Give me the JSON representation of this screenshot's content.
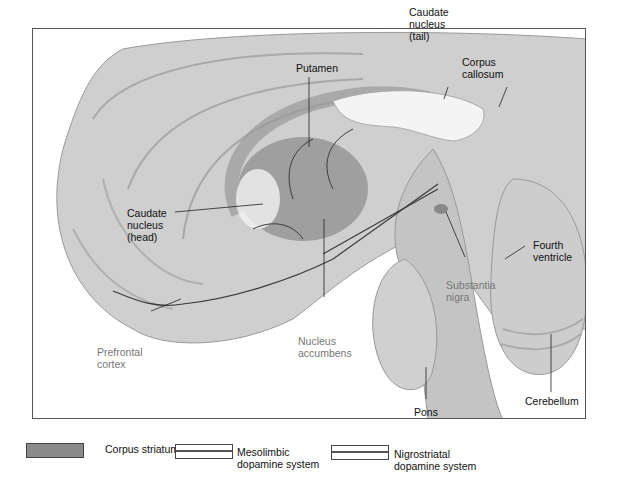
{
  "figure": {
    "labels": [
      {
        "id": "putamen",
        "text": "Putamen"
      },
      {
        "id": "caudate-tail",
        "text": "Caudate\nnucleus\n(tail)"
      },
      {
        "id": "corpus-callosum",
        "text": "Corpus\ncallosum"
      },
      {
        "id": "caudate-head",
        "text": "Caudate\nnucleus\n(head)"
      },
      {
        "id": "fourth-ventricle",
        "text": "Fourth\nventricle"
      },
      {
        "id": "substantia-nigra",
        "text": "Substantia\nnigra"
      },
      {
        "id": "prefrontal-cortex",
        "text": "Prefrontal\ncortex"
      },
      {
        "id": "nucleus-accumbens",
        "text": "Nucleus\naccumbens"
      },
      {
        "id": "pons",
        "text": "Pons"
      },
      {
        "id": "cerebellum",
        "text": "Cerebellum"
      }
    ]
  },
  "legend": {
    "items": [
      {
        "label": "Corpus striatum",
        "style": "solid-fill",
        "color": "#8a8a8a"
      },
      {
        "label": "Mesolimbic\ndopamine system",
        "style": "double-line"
      },
      {
        "label": "Nigrostriatal\ndopamine system",
        "style": "double-line"
      }
    ]
  },
  "colors": {
    "brain_light": "#d2d2d2",
    "brain_mid": "#b8b8b8",
    "striatum": "#8f8f8f",
    "pathway": "#3a3a3a",
    "frame": "#555555"
  }
}
